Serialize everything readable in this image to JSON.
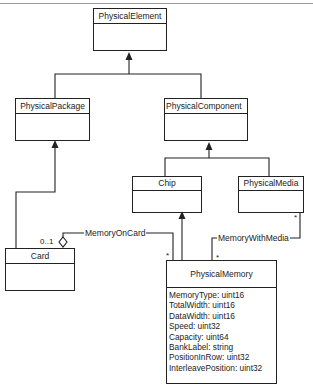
{
  "diagram": {
    "type": "UML class diagram",
    "classes": {
      "physical_element": {
        "name": "PhysicalElement",
        "attributes": []
      },
      "physical_package": {
        "name": "PhysicalPackage",
        "attributes": []
      },
      "physical_component": {
        "name": "PhysicalComponent",
        "attributes": []
      },
      "chip": {
        "name": "Chip",
        "attributes": []
      },
      "physical_media": {
        "name": "PhysicalMedia",
        "attributes": []
      },
      "card": {
        "name": "Card",
        "attributes": []
      },
      "physical_memory": {
        "name": "PhysicalMemory",
        "attributes": [
          "MemoryType:  uint16",
          "TotalWidth:  uint16",
          "DataWidth:  uint16",
          "Speed:  uint32",
          "Capacity:  uint64",
          "BankLabel:  string",
          "PositionInRow:  uint32",
          "InterleavePosition:  uint32"
        ]
      }
    },
    "associations": {
      "memory_on_card": {
        "label": "MemoryOnCard",
        "card_multiplicity": "0..1",
        "memory_multiplicity": "*"
      },
      "memory_with_media": {
        "label": "MemoryWithMedia",
        "media_multiplicity": "*",
        "memory_multiplicity": "*"
      }
    },
    "generalizations": [
      {
        "child": "PhysicalPackage",
        "parent": "PhysicalElement"
      },
      {
        "child": "PhysicalComponent",
        "parent": "PhysicalElement"
      },
      {
        "child": "Chip",
        "parent": "PhysicalComponent"
      },
      {
        "child": "PhysicalMedia",
        "parent": "PhysicalComponent"
      },
      {
        "child": "Card",
        "parent": "PhysicalPackage"
      },
      {
        "child": "PhysicalMemory",
        "parent": "Chip"
      }
    ]
  }
}
